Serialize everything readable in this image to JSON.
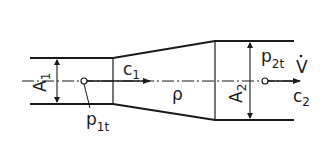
{
  "diagram": {
    "type": "diffuser-flow-schematic",
    "labels": {
      "A1": "A",
      "A1_sub": "1",
      "c1": "c",
      "c1_sub": "1",
      "rho": "ρ",
      "A2": "A",
      "A2_sub": "2",
      "p2t": "p",
      "p2t_sub": "2t",
      "Vdot": "V",
      "c2": "c",
      "c2_sub": "2",
      "p1t": "p",
      "p1t_sub": "1t"
    },
    "colors": {
      "line": "#1a1a1a",
      "background": "#ffffff"
    }
  }
}
